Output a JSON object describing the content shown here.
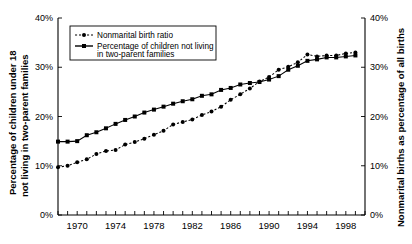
{
  "chart_data": {
    "type": "line",
    "title": "",
    "xlabel": "",
    "ylabel": "Percentage of children under 18 not living in two-parent families",
    "ylabel_right": "Nonmarital births as percentage of all births",
    "xlim": [
      1968,
      2000
    ],
    "ylim": [
      0,
      40
    ],
    "ytick_labels": [
      "0%",
      "10%",
      "20%",
      "30%",
      "40%"
    ],
    "ytick_values": [
      0,
      10,
      20,
      30,
      40
    ],
    "ytick_labels_right": [
      "0%",
      "10%",
      "20%",
      "30%",
      "40%"
    ],
    "xtick_labels": [
      "1970",
      "1974",
      "1978",
      "1982",
      "1986",
      "1990",
      "1994",
      "1998"
    ],
    "xtick_values": [
      1970,
      1974,
      1978,
      1982,
      1986,
      1990,
      1994,
      1998
    ],
    "x_minor_ticks": [
      1968,
      1969,
      1970,
      1971,
      1972,
      1973,
      1974,
      1975,
      1976,
      1977,
      1978,
      1979,
      1980,
      1981,
      1982,
      1983,
      1984,
      1985,
      1986,
      1987,
      1988,
      1989,
      1990,
      1991,
      1992,
      1993,
      1994,
      1995,
      1996,
      1997,
      1998,
      1999,
      2000
    ],
    "grid": false,
    "legend_position": "upper-left",
    "x": [
      1968,
      1969,
      1970,
      1971,
      1972,
      1973,
      1974,
      1975,
      1976,
      1977,
      1978,
      1979,
      1980,
      1981,
      1982,
      1983,
      1984,
      1985,
      1986,
      1987,
      1988,
      1989,
      1990,
      1991,
      1992,
      1993,
      1994,
      1995,
      1996,
      1997,
      1998,
      1999
    ],
    "series": [
      {
        "name": "Nonmarital birth ratio",
        "style": "dotted",
        "axis": "right",
        "values": [
          9.7,
          10.0,
          10.7,
          11.3,
          12.4,
          13.0,
          13.2,
          14.3,
          14.8,
          15.5,
          16.3,
          17.1,
          18.4,
          18.9,
          19.4,
          20.3,
          21.0,
          22.0,
          23.4,
          24.5,
          25.7,
          27.1,
          28.0,
          29.5,
          30.1,
          31.0,
          32.6,
          32.2,
          32.4,
          32.4,
          32.8,
          33.0
        ]
      },
      {
        "name": "Percentage of children not living in two-parent families",
        "style": "solid",
        "axis": "left",
        "values": [
          14.9,
          14.9,
          15.0,
          16.2,
          16.8,
          17.6,
          18.5,
          19.3,
          20.0,
          20.8,
          21.4,
          22.0,
          22.6,
          23.1,
          23.5,
          24.2,
          24.5,
          25.4,
          25.8,
          26.5,
          26.8,
          27.0,
          27.5,
          28.2,
          29.5,
          30.3,
          31.3,
          31.6,
          32.0,
          32.0,
          32.2,
          32.4
        ]
      }
    ],
    "legend": [
      {
        "label": "Nonmarital birth ratio",
        "style": "dotted"
      },
      {
        "label": "Percentage of children not living",
        "style": "solid"
      },
      {
        "label": "in two-parent families",
        "style": "continuation"
      }
    ]
  },
  "labels": {
    "left_axis_title_line1": "Percentage of children under 18",
    "left_axis_title_line2": "not living in two-parent families",
    "right_axis_title": "Nonmarital births as percentage of all births"
  },
  "colors": {
    "ink": "#000000",
    "background": "#ffffff"
  }
}
